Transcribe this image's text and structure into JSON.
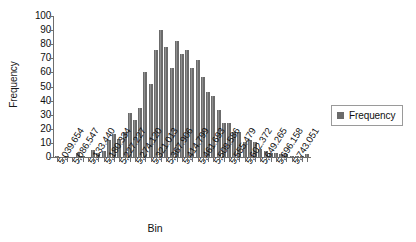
{
  "chart_data": {
    "type": "bar",
    "title": "",
    "xlabel": "Bin",
    "ylabel": "Frequency",
    "ylim": [
      0,
      100
    ],
    "ytick_step": 10,
    "ytick_labels": [
      "0",
      "10",
      "20",
      "30",
      "40",
      "50",
      "60",
      "70",
      "80",
      "90",
      "100"
    ],
    "grid": false,
    "legend_position": "right",
    "series": [
      {
        "name": "Frequency",
        "color": "#6b6b6b",
        "values": [
          1,
          0,
          1,
          0,
          3,
          1,
          0,
          5,
          3,
          4,
          12,
          16,
          13,
          18,
          31,
          26,
          35,
          60,
          52,
          76,
          90,
          78,
          63,
          82,
          73,
          76,
          63,
          69,
          57,
          46,
          43,
          33,
          24,
          24,
          18,
          18,
          11,
          12,
          11,
          6,
          4,
          3,
          3,
          2,
          2,
          1,
          1,
          1,
          2
        ]
      }
    ],
    "categories": [
      "5,039.654",
      "5,055.285",
      "5,070.916",
      "5,086.547",
      "5,102.178",
      "5,117.809",
      "5,133.440",
      "5,149.071",
      "5,164.702",
      "5,180.334",
      "5,195.965",
      "5,211.596",
      "5,227.227",
      "5,242.858",
      "5,258.489",
      "5,274.120",
      "5,289.751",
      "5,305.382",
      "5,321.013",
      "5,336.644",
      "5,352.275",
      "5,367.906",
      "5,383.537",
      "5,399.168",
      "5,414.799",
      "5,430.430",
      "5,446.062",
      "5,461.693",
      "5,477.324",
      "5,492.955",
      "5,508.586",
      "5,524.217",
      "5,539.848",
      "5,555.479",
      "5,571.110",
      "5,586.741",
      "5,602.372",
      "5,618.003",
      "5,633.634",
      "5,649.265",
      "5,664.896",
      "5,680.527",
      "5,696.158",
      "5,711.789",
      "5,727.420",
      "5,743.051",
      "5,758.682",
      "5,774.313",
      "5,789.944"
    ],
    "visible_tick_labels": [
      "5,039.654",
      "5,086.547",
      "5,133.440",
      "5,180.334",
      "5,227.227",
      "5,274.120",
      "5,321.013",
      "5,367.906",
      "5,414.799",
      "5,461.693",
      "5,508.586",
      "5,555.479",
      "5,602.372",
      "5,649.265",
      "5,696.158",
      "5,743.051"
    ],
    "tick_label_interval": 3
  },
  "legend": {
    "label": "Frequency"
  },
  "colors": {
    "bar": "#6b6b6b",
    "bar_highlight": "#8f8f8f",
    "axis": "#6e6e6e",
    "text": "#101010",
    "legend_border": "#9a9a9a",
    "background": "#ffffff"
  }
}
